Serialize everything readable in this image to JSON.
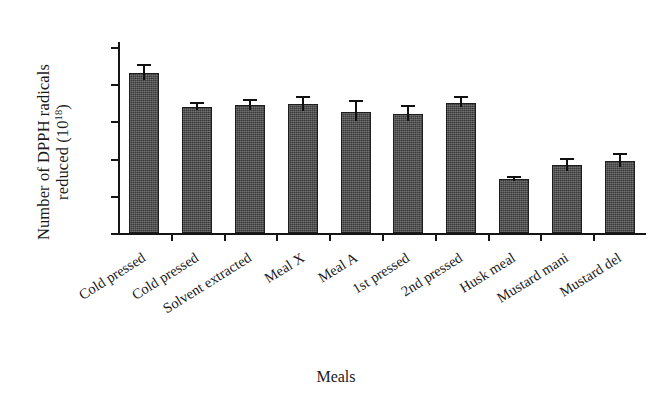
{
  "axes": {
    "ylabel_line1": "Number of DPPH radicals",
    "ylabel_line2_prefix": "reduced (10",
    "ylabel_line2_sup": "18",
    "ylabel_line2_suffix": ")",
    "xlabel": "Meals"
  },
  "chart_data": {
    "type": "bar",
    "title": "",
    "xlabel": "Meals",
    "ylabel": "Number of DPPH radicals reduced (10^18)",
    "ylim": [
      0,
      25
    ],
    "ytick_labels": [
      "25",
      "20",
      "20",
      "10",
      "5",
      "0"
    ],
    "ytick_values": [
      25,
      20,
      15,
      10,
      5,
      0
    ],
    "grid": false,
    "legend": "none",
    "categories": [
      "Cold pressed",
      "Cold pressed",
      "Solvent extracted",
      "Meal X",
      "Meal A",
      "1st pressed",
      "2nd pressed",
      "Husk meal",
      "Mustard mani",
      "Mustard del"
    ],
    "values": [
      21.5,
      17.0,
      17.2,
      17.3,
      16.3,
      16.0,
      17.5,
      7.2,
      9.1,
      9.7
    ],
    "errors": [
      0.9,
      0.4,
      0.6,
      0.9,
      1.3,
      0.9,
      0.6,
      0.2,
      0.7,
      0.8
    ],
    "bar_color": "#3a3a3a",
    "error_color": "#101010"
  }
}
